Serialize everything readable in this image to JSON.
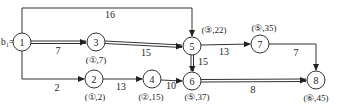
{
  "diagram": {
    "type": "network-diagram",
    "start_label": "b₁=0",
    "nodes": [
      {
        "id": "1",
        "x": 22,
        "y": 42,
        "annotation": ""
      },
      {
        "id": "3",
        "x": 96,
        "y": 42,
        "annotation": "(①,7)"
      },
      {
        "id": "5",
        "x": 192,
        "y": 46,
        "annotation": "(③,22)"
      },
      {
        "id": "7",
        "x": 260,
        "y": 44,
        "annotation": "(⑤,35)"
      },
      {
        "id": "2",
        "x": 94,
        "y": 79,
        "annotation": "(①,2)"
      },
      {
        "id": "4",
        "x": 152,
        "y": 79,
        "annotation": "(②,15)"
      },
      {
        "id": "6",
        "x": 192,
        "y": 81,
        "annotation": "(⑤,37)"
      },
      {
        "id": "8",
        "x": 316,
        "y": 80,
        "annotation": "(⑥,45)"
      }
    ],
    "edges": [
      {
        "from": "1",
        "to": "5",
        "weight": "16",
        "critical": false
      },
      {
        "from": "1",
        "to": "3",
        "weight": "7",
        "critical": true
      },
      {
        "from": "3",
        "to": "5",
        "weight": "15",
        "critical": true
      },
      {
        "from": "5",
        "to": "7",
        "weight": "13",
        "critical": false
      },
      {
        "from": "7",
        "to": "8",
        "weight": "7",
        "critical": false
      },
      {
        "from": "1",
        "to": "2",
        "weight": "2",
        "critical": false
      },
      {
        "from": "2",
        "to": "4",
        "weight": "13",
        "critical": false
      },
      {
        "from": "4",
        "to": "6",
        "weight": "10",
        "critical": false
      },
      {
        "from": "5",
        "to": "6",
        "weight": "15",
        "critical": true
      },
      {
        "from": "6",
        "to": "8",
        "weight": "8",
        "critical": true
      }
    ]
  }
}
